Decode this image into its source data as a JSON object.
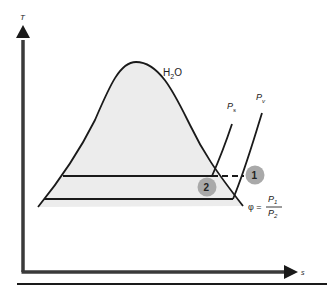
{
  "diagram": {
    "type": "T-s diagram",
    "axes": {
      "y_label": "T",
      "x_label": "s"
    },
    "substance_label": "H",
    "substance_sub": "2",
    "substance_tail": "O",
    "curves": {
      "ps_label": "P",
      "ps_sub": "s",
      "pv_label": "P",
      "pv_sub": "v"
    },
    "points": {
      "p1": "1",
      "p2": "2"
    },
    "formula": {
      "lhs": "φ =",
      "num": "P",
      "num_sub": "1",
      "den": "P",
      "den_sub": "2"
    },
    "colors": {
      "dome_fill": "#ececec",
      "line": "#1a1a1a",
      "axis": "#3a3a3a",
      "point_fill": "#a9a9a9"
    }
  }
}
